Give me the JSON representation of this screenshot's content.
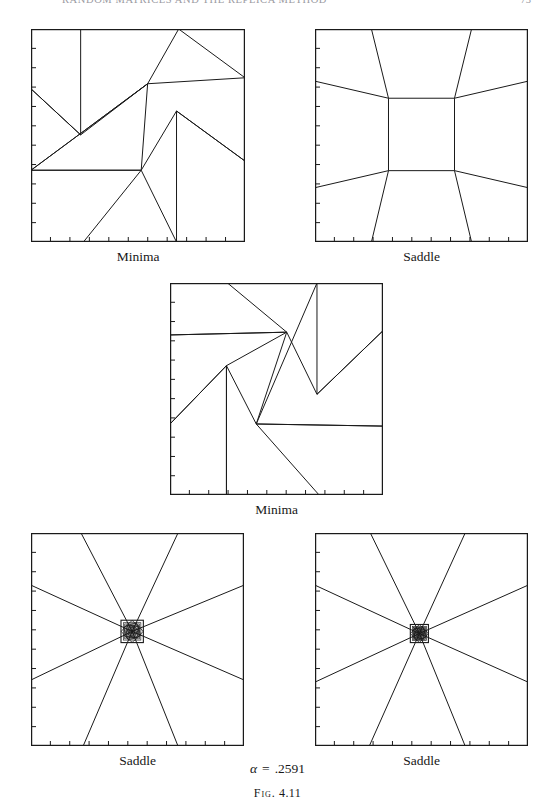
{
  "page": {
    "running_title": "RANDOM MATRICES AND THE REPLICA METHOD",
    "folio": "73",
    "alpha_symbol": "α",
    "alpha_equals": "=",
    "alpha_value": ".2591",
    "figure_label": "Fig.",
    "figure_number": "4.11"
  },
  "panels": [
    {
      "id": "top-left",
      "caption": "Minima",
      "type": "pinwheel",
      "box": {
        "x": 31,
        "y": 29,
        "w": 214,
        "h": 213
      },
      "ticks": {
        "left": 11,
        "bottom": 11,
        "length": 4
      },
      "line_color": "#1a1a1a",
      "line_width": 1.0,
      "vertices": [
        [
          0.232,
          0.0
        ],
        [
          0.232,
          0.497
        ],
        [
          0.0,
          0.281
        ],
        [
          0.232,
          0.497
        ],
        [
          0.545,
          0.257
        ],
        [
          0.0,
          0.663
        ],
        [
          0.545,
          0.257
        ],
        [
          0.69,
          0.0
        ],
        [
          1.0,
          0.229
        ],
        [
          0.545,
          0.257
        ],
        [
          0.515,
          0.663
        ],
        [
          0.0,
          0.663
        ],
        [
          0.515,
          0.663
        ],
        [
          0.68,
          0.385
        ],
        [
          1.0,
          0.62
        ],
        [
          0.68,
          0.385
        ],
        [
          0.68,
          1.0
        ],
        [
          0.515,
          0.663
        ],
        [
          0.245,
          1.0
        ]
      ]
    },
    {
      "id": "top-right",
      "caption": "Saddle",
      "type": "saddle-cell",
      "box": {
        "x": 315,
        "y": 29,
        "w": 213,
        "h": 213
      },
      "ticks": {
        "left": 11,
        "bottom": 11,
        "length": 4
      },
      "line_color": "#1a1a1a",
      "line_width": 1.0,
      "inner_rect": {
        "x0": 0.345,
        "y0": 0.325,
        "x1": 0.655,
        "y1": 0.665
      },
      "edge_points": {
        "top_left": 0.265,
        "top_right": 0.735,
        "bottom_left": 0.265,
        "bottom_right": 0.735,
        "left_top": 0.245,
        "left_bottom": 0.745,
        "right_top": 0.245,
        "right_bottom": 0.745
      }
    },
    {
      "id": "middle",
      "caption": "Minima",
      "type": "pinwheel",
      "box": {
        "x": 170,
        "y": 283,
        "w": 213,
        "h": 212
      },
      "ticks": {
        "left": 11,
        "bottom": 11,
        "length": 4
      },
      "line_color": "#1a1a1a",
      "line_width": 1.0,
      "vertices": [
        [
          0.27,
          0.0
        ],
        [
          0.548,
          0.232
        ],
        [
          0.0,
          0.245
        ],
        [
          0.548,
          0.232
        ],
        [
          0.265,
          0.39
        ],
        [
          0.0,
          0.665
        ],
        [
          0.265,
          0.39
        ],
        [
          0.265,
          1.0
        ],
        [
          0.265,
          0.39
        ],
        [
          0.405,
          0.665
        ],
        [
          1.0,
          0.675
        ],
        [
          0.405,
          0.665
        ],
        [
          0.69,
          0.0
        ],
        [
          0.69,
          0.525
        ],
        [
          1.0,
          0.225
        ],
        [
          0.69,
          0.525
        ],
        [
          0.548,
          0.232
        ],
        [
          0.405,
          0.665
        ],
        [
          0.7,
          1.0
        ]
      ]
    },
    {
      "id": "bottom-left",
      "caption": "Saddle",
      "type": "star",
      "box": {
        "x": 31,
        "y": 533,
        "w": 213,
        "h": 213
      },
      "ticks": {
        "left": 11,
        "bottom": 11,
        "length": 4
      },
      "line_color": "#1a1a1a",
      "line_width": 1.0,
      "center": [
        0.475,
        0.462
      ],
      "rays": [
        [
          0.235,
          0.0
        ],
        [
          0.69,
          0.0
        ],
        [
          1.0,
          0.245
        ],
        [
          1.0,
          0.69
        ],
        [
          0.69,
          1.0
        ],
        [
          0.245,
          1.0
        ],
        [
          0.0,
          0.69
        ],
        [
          0.0,
          0.245
        ]
      ],
      "core": {
        "size": 0.105,
        "rings": 7
      }
    },
    {
      "id": "bottom-right",
      "caption": "Saddle",
      "type": "star",
      "box": {
        "x": 315,
        "y": 533,
        "w": 213,
        "h": 213
      },
      "ticks": {
        "left": 11,
        "bottom": 11,
        "length": 4
      },
      "line_color": "#1a1a1a",
      "line_width": 1.0,
      "center": [
        0.49,
        0.472
      ],
      "rays": [
        [
          0.26,
          0.0
        ],
        [
          0.705,
          0.0
        ],
        [
          1.0,
          0.245
        ],
        [
          1.0,
          0.7
        ],
        [
          0.705,
          1.0
        ],
        [
          0.255,
          1.0
        ],
        [
          0.0,
          0.7
        ],
        [
          0.0,
          0.245
        ]
      ],
      "core": {
        "size": 0.085,
        "rings": 7
      }
    }
  ]
}
